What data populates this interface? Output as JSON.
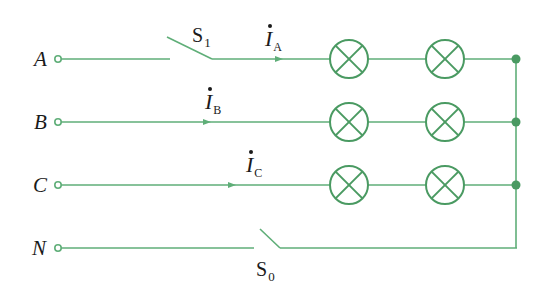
{
  "diagram": {
    "type": "three-phase four-wire circuit with lamp loads",
    "colors": {
      "wire": "#5fae78",
      "lamp": "#4a9a62",
      "node": "#4a9a62",
      "text": "#1a1a1a"
    },
    "phases": [
      {
        "label": "A",
        "current": {
          "symbol": "I",
          "sub": "A"
        }
      },
      {
        "label": "B",
        "current": {
          "symbol": "I",
          "sub": "B"
        }
      },
      {
        "label": "C",
        "current": {
          "symbol": "I",
          "sub": "C"
        }
      },
      {
        "label": "N"
      }
    ],
    "switches": [
      {
        "symbol": "S",
        "sub": "1",
        "on_line": "A",
        "state": "open"
      },
      {
        "symbol": "S",
        "sub": "0",
        "on_line": "N",
        "state": "open"
      }
    ],
    "lamps_per_phase": 2,
    "junction_nodes": 3
  }
}
